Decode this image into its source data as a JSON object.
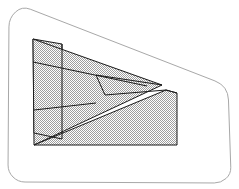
{
  "document": {
    "title": "Geometric Hatched Figure",
    "kind": "line-drawing",
    "canvas": {
      "width": 239,
      "height": 189,
      "background": "#ffffff"
    }
  },
  "colors": {
    "background": "#ffffff",
    "frame_stroke": "#a8a8a8",
    "shape_stroke": "#1a1a1a",
    "hatch_fill": "#b4b4b4",
    "hatch_background": "#ffffff",
    "panel_fill": "#c4c4c4"
  },
  "frame": {
    "label": "rounded-quadrilateral-frame",
    "stroke_width": 1,
    "corner_radius": 14,
    "points": [
      {
        "x": 9,
        "y": 18
      },
      {
        "x": 22,
        "y": 6
      },
      {
        "x": 228,
        "y": 86
      },
      {
        "x": 231,
        "y": 174
      },
      {
        "x": 221,
        "y": 183
      },
      {
        "x": 18,
        "y": 182
      },
      {
        "x": 8,
        "y": 172
      }
    ]
  },
  "shapes": [
    {
      "id": "left-striped-panel",
      "label": "left-striped-panel",
      "fill": "hatch",
      "stroke_width": 1,
      "points": [
        {
          "x": 33,
          "y": 39
        },
        {
          "x": 62,
          "y": 44
        },
        {
          "x": 62,
          "y": 139
        },
        {
          "x": 34,
          "y": 133
        }
      ]
    },
    {
      "id": "large-triangle",
      "label": "large-right-pointing-triangle",
      "fill": "hatch",
      "stroke_width": 1,
      "points": [
        {
          "x": 33,
          "y": 39
        },
        {
          "x": 162,
          "y": 85
        },
        {
          "x": 34,
          "y": 145
        }
      ]
    },
    {
      "id": "lower-right-quad",
      "label": "lower-right-quadrilateral",
      "fill": "hatch",
      "stroke_width": 1,
      "points": [
        {
          "x": 166,
          "y": 90
        },
        {
          "x": 177,
          "y": 93
        },
        {
          "x": 177,
          "y": 145
        },
        {
          "x": 34,
          "y": 145
        }
      ]
    }
  ],
  "lines": [
    {
      "id": "panel-stripe-upper",
      "label": "panel-stripe-upper",
      "from": {
        "x": 33,
        "y": 62
      },
      "to": {
        "x": 147,
        "y": 86
      }
    },
    {
      "id": "panel-stripe-lower",
      "label": "panel-stripe-lower",
      "from": {
        "x": 34,
        "y": 110
      },
      "to": {
        "x": 96,
        "y": 103
      }
    },
    {
      "id": "panel-vertical-edge",
      "label": "panel-vertical-edge",
      "from": {
        "x": 62,
        "y": 44
      },
      "to": {
        "x": 62,
        "y": 139
      }
    },
    {
      "id": "inner-fold-line",
      "label": "inner-fold-line",
      "from": {
        "x": 96,
        "y": 75
      },
      "to": {
        "x": 162,
        "y": 85
      }
    },
    {
      "id": "upper-flap-edge",
      "label": "upper-flap-edge",
      "from": {
        "x": 96,
        "y": 75
      },
      "to": {
        "x": 105,
        "y": 95
      }
    },
    {
      "id": "quad-top-edge",
      "label": "quad-top-edge",
      "from": {
        "x": 105,
        "y": 95
      },
      "to": {
        "x": 166,
        "y": 90
      }
    },
    {
      "id": "quad-left-slope",
      "label": "quad-left-slope",
      "from": {
        "x": 166,
        "y": 90
      },
      "to": {
        "x": 177,
        "y": 93
      }
    },
    {
      "id": "panel-bottom-notch",
      "label": "panel-bottom-notch",
      "from": {
        "x": 34,
        "y": 133
      },
      "to": {
        "x": 62,
        "y": 139
      }
    }
  ],
  "annotations": {
    "count_shapes": 3,
    "count_lines": 8,
    "pattern": "checkerboard-hatch"
  }
}
